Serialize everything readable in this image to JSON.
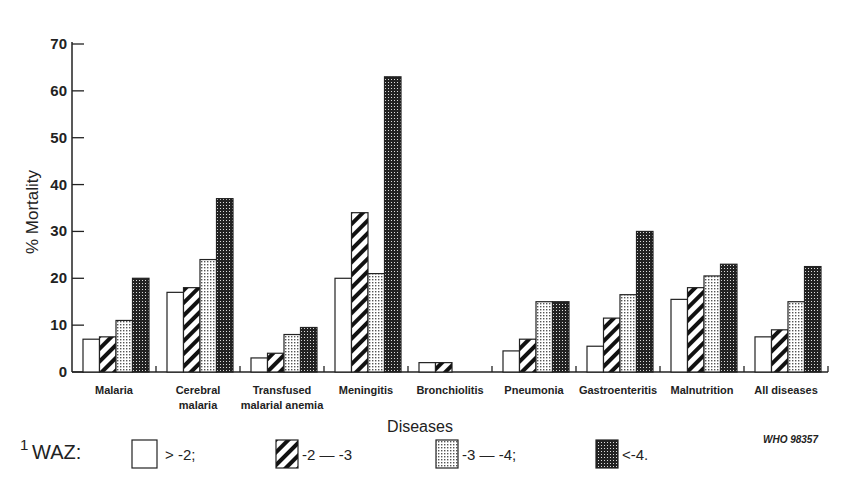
{
  "chart_data": {
    "type": "bar",
    "title": "",
    "xlabel": "Diseases",
    "ylabel": "% Mortality",
    "ylim": [
      0,
      70
    ],
    "yticks": [
      0,
      10,
      20,
      30,
      40,
      50,
      60,
      70
    ],
    "grid": false,
    "legend_position": "bottom",
    "legend_prefix": "WAZ:",
    "legend_footnote_marker": "1",
    "categories": [
      "Malaria",
      "Cerebral malaria",
      "Transfused malarial anemia",
      "Meningitis",
      "Bronchiolitis",
      "Pneumonia",
      "Gastroenteritis",
      "Malnutrition",
      "All diseases"
    ],
    "category_lines": [
      [
        "Malaria"
      ],
      [
        "Cerebral",
        "malaria"
      ],
      [
        "Transfused",
        "malarial anemia"
      ],
      [
        "Meningitis"
      ],
      [
        "Bronchiolitis"
      ],
      [
        "Pneumonia"
      ],
      [
        "Gastroenteritis"
      ],
      [
        "Malnutrition"
      ],
      [
        "All diseases"
      ]
    ],
    "series": [
      {
        "name": "> -2;",
        "pattern": "blank",
        "values": [
          7,
          17,
          3,
          20,
          2,
          4.5,
          5.5,
          15.5,
          7.5
        ]
      },
      {
        "name": "-2 — -3",
        "pattern": "diagonal",
        "values": [
          7.5,
          18,
          4,
          34,
          2,
          7,
          11.5,
          18,
          9
        ]
      },
      {
        "name": "-3 — -4;",
        "pattern": "light-dots",
        "values": [
          11,
          24,
          8,
          21,
          0,
          15,
          16.5,
          20.5,
          15
        ]
      },
      {
        "name": "<-4.",
        "pattern": "dark-dots",
        "values": [
          20,
          37,
          9.5,
          63,
          0,
          15,
          30,
          23,
          22.5
        ]
      }
    ],
    "annotation": "WHO 98357"
  }
}
